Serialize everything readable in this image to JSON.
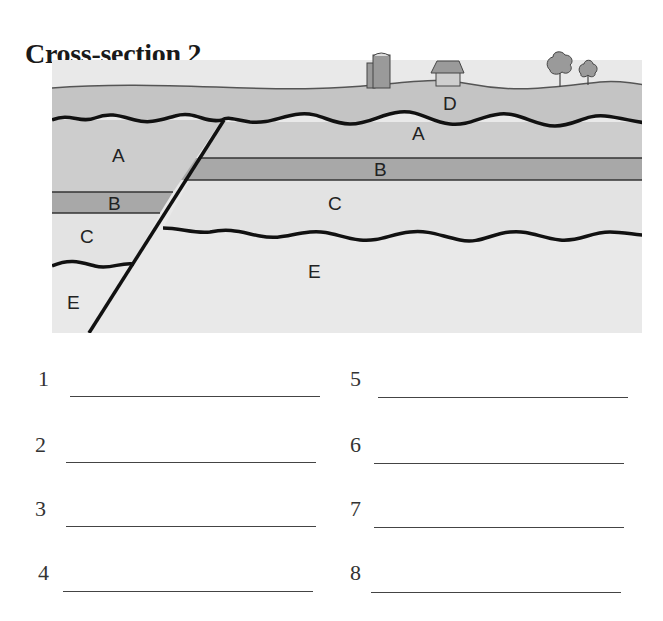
{
  "title": "Cross-section 2",
  "diagram": {
    "layers": {
      "D": "D",
      "A_left": "A",
      "A_right": "A",
      "B_left": "B",
      "B_right": "B",
      "C_left": "C",
      "C_right": "C",
      "E_left": "E",
      "E_right": "E"
    },
    "surface_features": [
      "silo",
      "house",
      "tree",
      "tree"
    ],
    "colors": {
      "D": "#c8c8c8",
      "A": "#cdcdcd",
      "B": "#a6a6a6",
      "C": "#e4e4e4",
      "E": "#e8e8e8",
      "line": "#111111"
    }
  },
  "answers": [
    {
      "num": "1",
      "value": ""
    },
    {
      "num": "2",
      "value": ""
    },
    {
      "num": "3",
      "value": ""
    },
    {
      "num": "4",
      "value": ""
    },
    {
      "num": "5",
      "value": ""
    },
    {
      "num": "6",
      "value": ""
    },
    {
      "num": "7",
      "value": ""
    },
    {
      "num": "8",
      "value": ""
    }
  ]
}
